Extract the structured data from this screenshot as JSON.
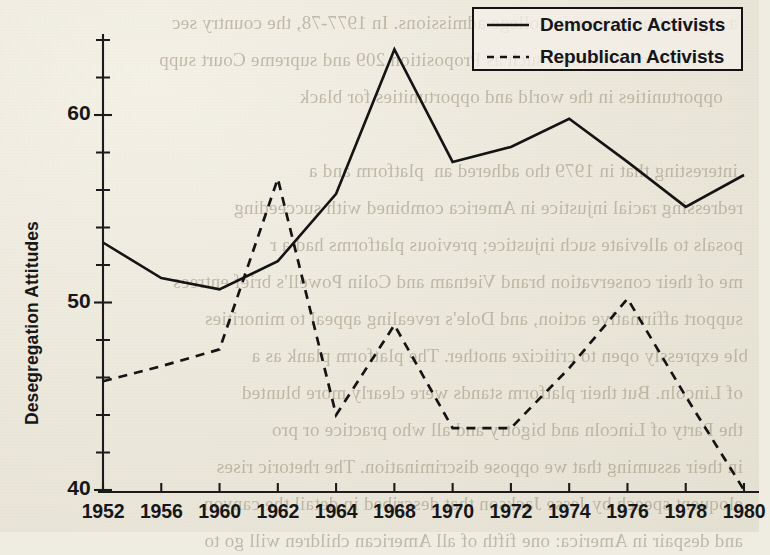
{
  "page": {
    "background_color": "#efece2",
    "ink_color": "#141414",
    "bleed_through_lines": [
      "   a segregation pattern in college admissions. In 1977-78, the country sec",
      "        a series of decisions, such as Proposition 209 and supreme Court supp",
      "      opportunities in the world and opportunities for black",
      "",
      "   interesting that in 1979 tho adhered an  platform and a",
      "  redressing racial injustice in America combined with succeeding",
      "  posals to alleviate such injustice; previous platforms had a r",
      "  me of their conservation brand Vietnam and Colin Powell's brief entrees",
      "  support affirmative action, and Dole's revealing appeal to minorities",
      " ble expressly open to criticize another. The platform plank as a",
      "  of Lincoln. But their platform stands were clearly more blunted",
      "  the Party of Lincoln and bigotry and all who practice or pro",
      "  in their assuming that we oppose discrimination. The rhetoric rises",
      "  eloquent speech by Jesse Jackson that described in detail the canyon",
      "  and despair in America: one fifth of all American children will go to"
    ]
  },
  "chart_data": {
    "type": "line",
    "title": "",
    "xlabel": "",
    "ylabel": "Desegregation Attitudes",
    "categories": [
      "1952",
      "1956",
      "1960",
      "1962",
      "1964",
      "1968",
      "1970",
      "1972",
      "1974",
      "1976",
      "1978",
      "1980"
    ],
    "ylim": [
      38.5,
      65.5
    ],
    "yticks_major": [
      40,
      50,
      60
    ],
    "yticks_major_labels": [
      "40",
      "50",
      "60"
    ],
    "ytick_minor_step": 2,
    "grid": false,
    "legend_position": "top-right",
    "series": [
      {
        "name": "Democratic Activists",
        "style": "solid",
        "values": [
          53.2,
          51.3,
          50.7,
          52.2,
          55.8,
          63.5,
          57.5,
          58.3,
          59.8,
          57.5,
          55.1,
          56.8
        ]
      },
      {
        "name": "Republican Activists",
        "style": "dashed",
        "values": [
          45.8,
          46.6,
          47.5,
          56.6,
          44.0,
          48.8,
          43.3,
          43.3,
          46.5,
          50.2,
          45.0,
          40.0
        ]
      }
    ]
  },
  "legend": {
    "items": [
      {
        "label": "Democratic Activists",
        "style": "solid"
      },
      {
        "label": "Republican Activists",
        "style": "dashed"
      }
    ]
  }
}
